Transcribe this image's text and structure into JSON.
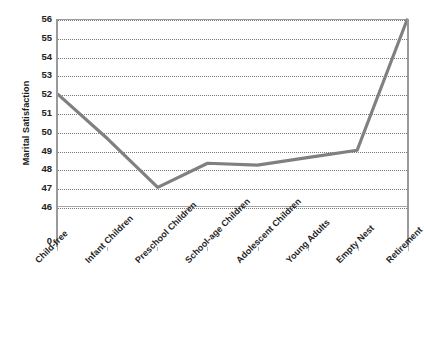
{
  "chart_data": {
    "type": "line",
    "title": "",
    "xlabel": "",
    "ylabel": "Marital Satisfaction",
    "categories": [
      "Child-free",
      "Infant Children",
      "Preschool Children",
      "School-age Children",
      "Adolescent Children",
      "Young Adults",
      "Empty Nest",
      "Retirement"
    ],
    "values": [
      52.0,
      49.6,
      47.0,
      48.3,
      48.2,
      48.6,
      49.0,
      56.0
    ],
    "series": [
      {
        "name": "Marital Satisfaction",
        "values": [
          52.0,
          49.6,
          47.0,
          48.3,
          48.2,
          48.6,
          49.0,
          56.0
        ],
        "color": "#808080"
      }
    ],
    "ylim": [
      46,
      56
    ],
    "y_ticks": [
      56,
      55,
      54,
      53,
      52,
      51,
      50,
      49,
      48,
      47,
      46,
      0
    ],
    "y_axis_break": true,
    "y_axis_break_note": "axis broken between 46 and 0",
    "grid": true,
    "grid_style": "dotted",
    "legend": false,
    "legend_position": "none",
    "line_color": "#808080",
    "border_color": "#a6a6a6",
    "markers": false
  },
  "axis": {
    "y_title": "Marital Satisfaction",
    "zero_label": "0"
  }
}
